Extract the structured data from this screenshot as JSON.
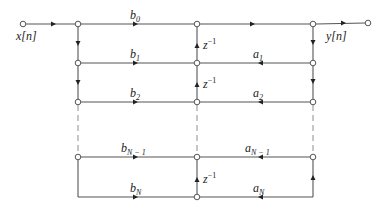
{
  "diagram": {
    "type": "signal-flow-graph",
    "title": "",
    "input_label": "x[n]",
    "output_label": "y[n]",
    "delay_label": "z",
    "delay_exp": "−1",
    "line_color": "#444444",
    "feedforward": [
      {
        "base": "b",
        "sub": "0"
      },
      {
        "base": "b",
        "sub": "1"
      },
      {
        "base": "b",
        "sub": "2"
      },
      {
        "base": "b",
        "sub": "N − 1"
      },
      {
        "base": "b",
        "sub": "N"
      }
    ],
    "feedback": [
      {
        "base": "a",
        "sub": "1"
      },
      {
        "base": "a",
        "sub": "2"
      },
      {
        "base": "a",
        "sub": "N − 1"
      },
      {
        "base": "a",
        "sub": "N"
      }
    ]
  }
}
